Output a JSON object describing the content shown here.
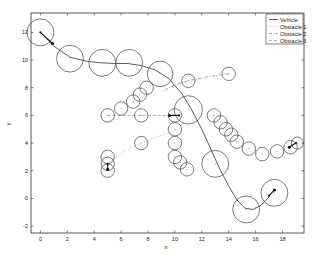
{
  "chart_data": {
    "type": "line",
    "title": "",
    "xlabel": "x",
    "ylabel": "y",
    "xlim": [
      -0.7,
      19.6
    ],
    "ylim": [
      -2.5,
      13.4
    ],
    "xticks": [
      0,
      2,
      4,
      6,
      8,
      10,
      12,
      14,
      16,
      18
    ],
    "yticks": [
      -2,
      0,
      2,
      4,
      6,
      8,
      10,
      12
    ],
    "grid": false,
    "legend_position": "upper right",
    "legend": [
      "Vehicle",
      "Obstacle 1",
      "Obstacle 2",
      "Obstacle 3"
    ],
    "series": [
      {
        "name": "Vehicle",
        "style": "solid",
        "color": "#333333",
        "path": [
          [
            0,
            12
          ],
          [
            1,
            11
          ],
          [
            2.2,
            10.2
          ],
          [
            3.5,
            9.9
          ],
          [
            4.5,
            9.8
          ],
          [
            5.5,
            9.75
          ],
          [
            6.5,
            9.75
          ],
          [
            7.5,
            9.6
          ],
          [
            8.5,
            9.3
          ],
          [
            9.5,
            8.7
          ],
          [
            10.5,
            7.6
          ],
          [
            11.2,
            6.5
          ],
          [
            12,
            5
          ],
          [
            12.7,
            3.5
          ],
          [
            13.3,
            2.2
          ],
          [
            14,
            0.9
          ],
          [
            14.6,
            -0.1
          ],
          [
            15.2,
            -0.7
          ],
          [
            15.8,
            -0.8
          ],
          [
            16.4,
            -0.5
          ],
          [
            17,
            0.1
          ]
        ],
        "circles": [
          {
            "x": 0,
            "y": 12,
            "r": 1.0
          },
          {
            "x": 2.2,
            "y": 10.1,
            "r": 1.0
          },
          {
            "x": 4.6,
            "y": 9.8,
            "r": 1.0
          },
          {
            "x": 6.6,
            "y": 9.8,
            "r": 1.0
          },
          {
            "x": 8.9,
            "y": 9.0,
            "r": 0.95
          },
          {
            "x": 11.0,
            "y": 6.4,
            "r": 1.05
          },
          {
            "x": 13.0,
            "y": 2.5,
            "r": 1.0
          },
          {
            "x": 15.3,
            "y": -0.8,
            "r": 1.0
          },
          {
            "x": 17.4,
            "y": 0.4,
            "r": 1.0
          }
        ],
        "arrows": [
          {
            "from": [
              0,
              12
            ],
            "to": [
              0.9,
              11.2
            ]
          },
          {
            "from": [
              17,
              0.2
            ],
            "to": [
              17.4,
              0.6
            ]
          }
        ]
      },
      {
        "name": "Obstacle 1",
        "style": "dotted",
        "color": "#bbbbbb",
        "path": [
          [
            5,
            2.5
          ],
          [
            6.2,
            3.4
          ],
          [
            7.5,
            4.0
          ],
          [
            8.8,
            4.5
          ],
          [
            10,
            4.9
          ],
          [
            11,
            5.3
          ]
        ],
        "circles": [
          {
            "x": 5,
            "y": 2.0,
            "r": 0.5
          },
          {
            "x": 5,
            "y": 2.5,
            "r": 0.5
          },
          {
            "x": 5,
            "y": 3.0,
            "r": 0.5
          },
          {
            "x": 7.5,
            "y": 4.0,
            "r": 0.5
          },
          {
            "x": 10,
            "y": 5.0,
            "r": 0.5
          },
          {
            "x": 10,
            "y": 4.0,
            "r": 0.5
          },
          {
            "x": 10,
            "y": 3.0,
            "r": 0.5
          },
          {
            "x": 10.4,
            "y": 2.6,
            "r": 0.5
          },
          {
            "x": 10.9,
            "y": 2.1,
            "r": 0.5
          }
        ],
        "arrows": [
          {
            "from": [
              5,
              2.5
            ],
            "to": [
              5,
              2.1
            ]
          }
        ]
      },
      {
        "name": "Obstacle 2",
        "style": "dashdot",
        "color": "#888888",
        "path": [
          [
            14,
            9
          ],
          [
            12.5,
            8.8
          ],
          [
            11,
            8.5
          ],
          [
            10,
            8.2
          ],
          [
            9,
            7.7
          ]
        ],
        "circles": [
          {
            "x": 14,
            "y": 9.0,
            "r": 0.5
          },
          {
            "x": 11,
            "y": 8.5,
            "r": 0.5
          },
          {
            "x": 12.9,
            "y": 6.0,
            "r": 0.5
          },
          {
            "x": 13.4,
            "y": 5.5,
            "r": 0.5
          },
          {
            "x": 13.8,
            "y": 5.0,
            "r": 0.5
          },
          {
            "x": 14.2,
            "y": 4.6,
            "r": 0.5
          },
          {
            "x": 14.6,
            "y": 4.1,
            "r": 0.5
          },
          {
            "x": 15.5,
            "y": 3.6,
            "r": 0.5
          },
          {
            "x": 16.5,
            "y": 3.2,
            "r": 0.5
          },
          {
            "x": 17.6,
            "y": 3.4,
            "r": 0.5
          },
          {
            "x": 18.6,
            "y": 3.7,
            "r": 0.5
          },
          {
            "x": 19.1,
            "y": 4.0,
            "r": 0.45
          }
        ],
        "arrows": [
          {
            "from": [
              19,
              4
            ],
            "to": [
              18.5,
              3.7
            ]
          }
        ]
      },
      {
        "name": "Obstacle 3",
        "style": "dashed",
        "color": "#999999",
        "path": [
          [
            5,
            6
          ],
          [
            7.5,
            6
          ],
          [
            10,
            6
          ]
        ],
        "circles": [
          {
            "x": 5,
            "y": 6.0,
            "r": 0.5
          },
          {
            "x": 6.0,
            "y": 6.5,
            "r": 0.5
          },
          {
            "x": 6.9,
            "y": 7.0,
            "r": 0.5
          },
          {
            "x": 7.4,
            "y": 7.5,
            "r": 0.5
          },
          {
            "x": 7.9,
            "y": 8.0,
            "r": 0.5
          },
          {
            "x": 7.5,
            "y": 6.0,
            "r": 0.5
          },
          {
            "x": 10,
            "y": 6.0,
            "r": 0.5
          }
        ],
        "arrows": [
          {
            "from": [
              10.3,
              6
            ],
            "to": [
              9.6,
              6
            ]
          }
        ]
      }
    ]
  },
  "axes": {
    "xlabel": "x",
    "ylabel": "y",
    "xtick_labels": [
      "0",
      "2",
      "4",
      "6",
      "8",
      "10",
      "12",
      "14",
      "16",
      "18"
    ],
    "ytick_labels": [
      "-2",
      "0",
      "2",
      "4",
      "6",
      "8",
      "10",
      "12"
    ]
  },
  "legend": {
    "items": [
      {
        "label": "Vehicle"
      },
      {
        "label": "Obstacle 1"
      },
      {
        "label": "Obstacle 2"
      },
      {
        "label": "Obstacle 3"
      }
    ]
  }
}
